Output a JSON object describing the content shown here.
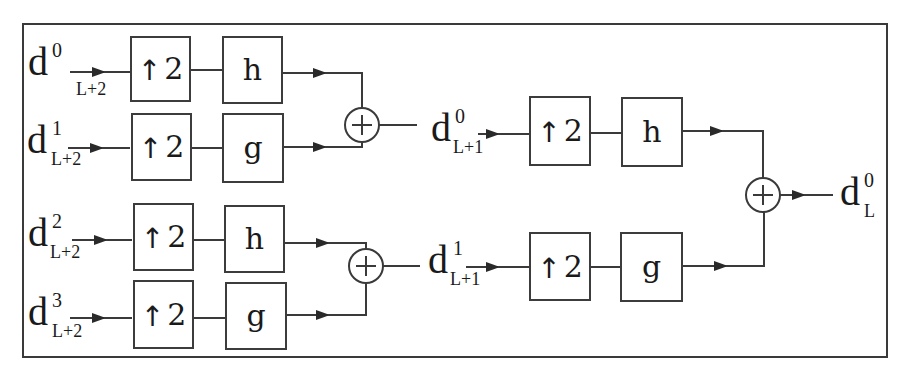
{
  "diagram": {
    "stage1": {
      "inputs": [
        {
          "base": "d",
          "sup": "0",
          "sub": "L+2"
        },
        {
          "base": "d",
          "sup": "1",
          "sub": "L+2"
        },
        {
          "base": "d",
          "sup": "2",
          "sub": "L+2"
        },
        {
          "base": "d",
          "sup": "3",
          "sub": "L+2"
        }
      ],
      "upsamplers": [
        {
          "arrow": "↑",
          "factor": "2"
        },
        {
          "arrow": "↑",
          "factor": "2"
        },
        {
          "arrow": "↑",
          "factor": "2"
        },
        {
          "arrow": "↑",
          "factor": "2"
        }
      ],
      "filters": [
        {
          "label": "h"
        },
        {
          "label": "g"
        },
        {
          "label": "h"
        },
        {
          "label": "g"
        }
      ],
      "adders": [
        {
          "symbol": "+"
        },
        {
          "symbol": "+"
        }
      ]
    },
    "stage2": {
      "inputs": [
        {
          "base": "d",
          "sup": "0",
          "sub": "L+1"
        },
        {
          "base": "d",
          "sup": "1",
          "sub": "L+1"
        }
      ],
      "upsamplers": [
        {
          "arrow": "↑",
          "factor": "2"
        },
        {
          "arrow": "↑",
          "factor": "2"
        }
      ],
      "filters": [
        {
          "label": "h"
        },
        {
          "label": "g"
        }
      ],
      "adder": {
        "symbol": "+"
      }
    },
    "output": {
      "base": "d",
      "sup": "0",
      "sub": "L"
    },
    "colors": {
      "stroke": "#3a3a3a",
      "background": "#ffffff",
      "text": "#1a1a1a"
    }
  }
}
